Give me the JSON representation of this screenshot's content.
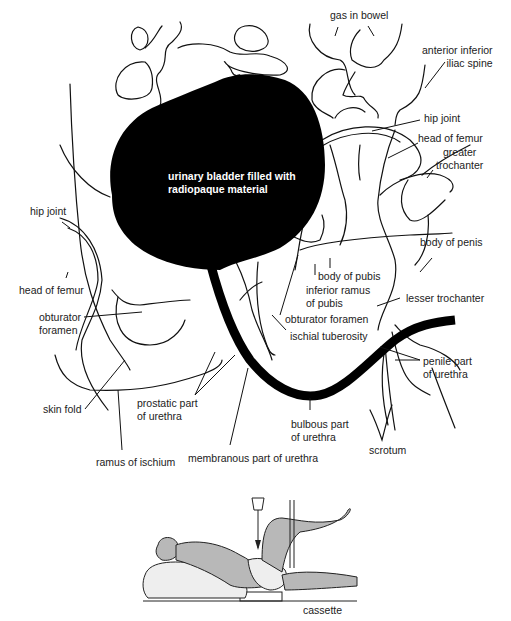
{
  "diagram": {
    "type": "anatomical radiograph tracing",
    "colors": {
      "contrast": "#000000",
      "line": "#111111",
      "figure_fill": "#b8b8b8",
      "background": "#ffffff"
    },
    "bladder_label": [
      "urinary bladder filled with",
      "radiopaque material"
    ],
    "labels": {
      "gas_in_bowel": "gas in bowel",
      "anterior_inferior_iliac_spine": [
        "anterior inferior",
        "iliac spine"
      ],
      "hip_joint_right": "hip joint",
      "head_of_femur_right": "head of femur",
      "greater_trochanter": [
        "greater",
        "trochanter"
      ],
      "hip_joint_left": "hip joint",
      "body_of_penis": "body of penis",
      "head_of_femur_left": "head of femur",
      "body_of_pubis": "body of pubis",
      "inferior_ramus_of_pubis": [
        "inferior ramus",
        "of pubis"
      ],
      "lesser_trochanter": "lesser trochanter",
      "obturator_foramen_left": [
        "obturator",
        "foramen"
      ],
      "obturator_foramen_right": "obturator foramen",
      "ischial_tuberosity": "ischial tuberosity",
      "penile_part_of_urethra": [
        "penile part",
        "of urethra"
      ],
      "skin_fold": "skin fold",
      "prostatic_part_of_urethra": [
        "prostatic part",
        "of urethra"
      ],
      "bulbous_part_of_urethra": [
        "bulbous part",
        "of urethra"
      ],
      "scrotum": "scrotum",
      "ramus_of_ischium": "ramus of ischium",
      "membranous_part_of_urethra": "membranous part of urethra"
    },
    "inset": {
      "description": "patient supine, oblique position with leg raised, X-ray beam directed downward",
      "cassette_label": "cassette"
    }
  }
}
